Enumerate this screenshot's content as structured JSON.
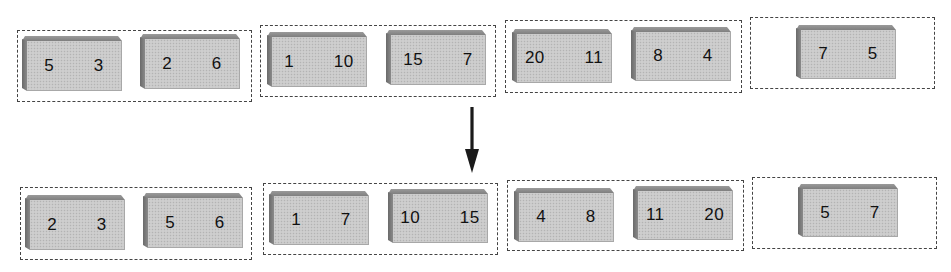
{
  "diagram": {
    "before": {
      "groups": [
        {
          "blocks": [
            {
              "a": "5",
              "b": "3"
            },
            {
              "a": "2",
              "b": "6"
            }
          ]
        },
        {
          "blocks": [
            {
              "a": "1",
              "b": "10"
            },
            {
              "a": "15",
              "b": "7"
            }
          ]
        },
        {
          "blocks": [
            {
              "a": "20",
              "b": "11"
            },
            {
              "a": "8",
              "b": "4"
            }
          ]
        },
        {
          "blocks": [
            {
              "a": "7",
              "b": "5"
            }
          ]
        }
      ]
    },
    "after": {
      "groups": [
        {
          "blocks": [
            {
              "a": "2",
              "b": "3"
            },
            {
              "a": "5",
              "b": "6"
            }
          ]
        },
        {
          "blocks": [
            {
              "a": "1",
              "b": "7"
            },
            {
              "a": "10",
              "b": "15"
            }
          ]
        },
        {
          "blocks": [
            {
              "a": "4",
              "b": "8"
            },
            {
              "a": "11",
              "b": "20"
            }
          ]
        },
        {
          "blocks": [
            {
              "a": "5",
              "b": "7"
            }
          ]
        }
      ]
    },
    "arrow": {
      "direction": "down",
      "color": "#1a1a1a"
    },
    "colors": {
      "block_face": "#c9c9c9",
      "block_bevel": "#7f7f7f",
      "dashed_border": "#444444",
      "text": "#111111"
    }
  }
}
